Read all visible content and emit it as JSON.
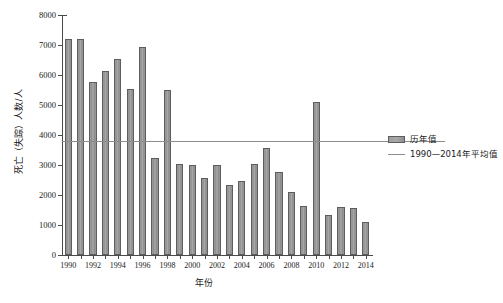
{
  "chart_data": {
    "type": "bar",
    "title": "",
    "xlabel": "年份",
    "ylabel": "死亡（失踪）人数/人",
    "ylim": [
      0,
      8000
    ],
    "ytick_values": [
      0,
      1000,
      2000,
      3000,
      4000,
      5000,
      6000,
      7000,
      8000
    ],
    "ytick_labels": [
      "0",
      "1000",
      "2000",
      "3000",
      "4000",
      "5000",
      "6000",
      "7000",
      "8000"
    ],
    "grid": false,
    "legend_position": "right",
    "categories": [
      "1990",
      "1991",
      "1992",
      "1993",
      "1994",
      "1995",
      "1996",
      "1997",
      "1998",
      "1999",
      "2000",
      "2001",
      "2002",
      "2003",
      "2004",
      "2005",
      "2006",
      "2007",
      "2008",
      "2009",
      "2010",
      "2011",
      "2012",
      "2013",
      "2014"
    ],
    "xtick_labels": [
      "1990",
      "1992",
      "1994",
      "1996",
      "1998",
      "2000",
      "2002",
      "2004",
      "2006",
      "2008",
      "2010",
      "2012",
      "2014"
    ],
    "series": [
      {
        "name": "历年值",
        "type": "bar",
        "color": "#9b9b9b",
        "values": [
          7200,
          7200,
          5780,
          6130,
          6550,
          5520,
          6940,
          3230,
          5500,
          3030,
          3000,
          2580,
          2990,
          2330,
          2480,
          3030,
          3560,
          2760,
          2090,
          1620,
          5100,
          1320,
          1610,
          1560,
          1110
        ]
      },
      {
        "name": "1990—2014年平均值",
        "type": "line",
        "color": "#8c8c8c",
        "value": 3800
      }
    ],
    "legend": [
      {
        "label": "历年值",
        "marker": "bar-swatch",
        "color": "#9b9b9b"
      },
      {
        "label": "1990—2014年平均值",
        "marker": "line-swatch",
        "color": "#8c8c8c"
      }
    ]
  },
  "axes": {
    "y_title": "死亡（失踪）人数/人",
    "x_title": "年份"
  }
}
